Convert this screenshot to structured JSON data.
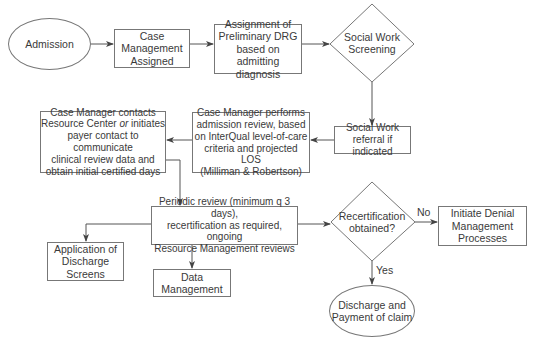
{
  "diagram": {
    "type": "flowchart",
    "nodes": {
      "admission": {
        "shape": "ellipse",
        "text": "Admission"
      },
      "case_mgmt_assigned": {
        "shape": "rectangle",
        "text": "Case\nManagement\nAssigned"
      },
      "drg_assignment": {
        "shape": "rectangle",
        "text": "Assignment of\nPreliminary DRG\nbased on admitting\ndiagnosis"
      },
      "social_work_screening": {
        "shape": "diamond",
        "text": "Social Work\nScreening"
      },
      "social_work_referral": {
        "shape": "rectangle",
        "text": "Social Work\nreferral if indicated"
      },
      "admission_review": {
        "shape": "rectangle",
        "text": "Case Manager performs\nadmission review, based\non InterQual level-of-care\ncriteria and projected LOS\n(Milliman & Robertson)"
      },
      "resource_center_contact": {
        "shape": "rectangle",
        "text_before": "Case Manager contacts\nResource Center ",
        "text_italic": "or",
        "text_after": " initiates\npayer contact to communicate\nclinical review data and\nobtain initial certified days"
      },
      "periodic_review": {
        "shape": "rectangle",
        "text": "Periodic review (minimum q 3 days),\nrecertification as required, ongoing\nResource Management reviews"
      },
      "discharge_screens": {
        "shape": "rectangle",
        "text": "Application of\nDischarge\nScreens"
      },
      "data_management": {
        "shape": "rectangle",
        "text": "Data\nManagement"
      },
      "recertification": {
        "shape": "diamond",
        "text": "Recertification\nobtained?"
      },
      "denial_management": {
        "shape": "rectangle",
        "text": "Initiate Denial\nManagement\nProcesses"
      },
      "discharge_payment": {
        "shape": "ellipse",
        "text": "Discharge and\nPayment of claim"
      }
    },
    "edge_labels": {
      "no": "No",
      "yes": "Yes"
    },
    "edges": [
      [
        "admission",
        "case_mgmt_assigned"
      ],
      [
        "case_mgmt_assigned",
        "drg_assignment"
      ],
      [
        "drg_assignment",
        "social_work_screening"
      ],
      [
        "social_work_screening",
        "social_work_referral"
      ],
      [
        "social_work_referral",
        "admission_review"
      ],
      [
        "admission_review",
        "resource_center_contact"
      ],
      [
        "resource_center_contact",
        "periodic_review"
      ],
      [
        "periodic_review",
        "discharge_screens"
      ],
      [
        "periodic_review",
        "data_management"
      ],
      [
        "periodic_review",
        "recertification"
      ],
      [
        "recertification",
        "denial_management",
        "No"
      ],
      [
        "recertification",
        "discharge_payment",
        "Yes"
      ]
    ],
    "colors": {
      "line": "#555555",
      "border": "#777777",
      "text": "#3a3a3a",
      "background": "#ffffff"
    }
  }
}
